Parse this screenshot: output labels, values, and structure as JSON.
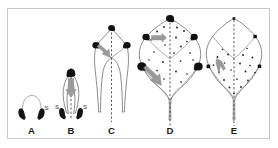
{
  "figure": {
    "background_color": "#ffffff",
    "frame_color": "#c8c8c8",
    "outline_color": "#6e6e6e",
    "midvein_color": "#4a4a4a",
    "gland_color": "#111111",
    "arrow_color": "#9a9a9a"
  },
  "stages": [
    {
      "id": "A",
      "label": "A",
      "description": "earliest primordium with paired stipules joined by arched rim",
      "stipule_label": "S",
      "gland_count": 2,
      "has_midvein": false,
      "has_growth_arrow": false
    },
    {
      "id": "B",
      "label": "B",
      "description": "primordium elongating, apical gland with basipetal growth arrow",
      "stipule_label": "S",
      "gland_count": 3,
      "has_midvein": true,
      "has_growth_arrow": true
    },
    {
      "id": "C",
      "label": "C",
      "description": "expanded blade with apical and two lateral glands, oblique arrow",
      "stipule_label": "",
      "gland_count": 3,
      "has_midvein": true,
      "has_growth_arrow": true
    },
    {
      "id": "D",
      "label": "D",
      "description": "broad blade with five marginal glands and scattered internal specks",
      "stipule_label": "",
      "gland_count": 5,
      "has_midvein": true,
      "has_growth_arrow": true
    },
    {
      "id": "E",
      "label": "E",
      "description": "mature blade, glands reduced to small specks, basal arrow",
      "stipule_label": "",
      "gland_count": 4,
      "has_midvein": true,
      "has_growth_arrow": true
    }
  ],
  "annotations": {
    "stipule_marker": "S",
    "arrow_meaning": "direction of developmental progression",
    "midvein_style": "dashed"
  }
}
